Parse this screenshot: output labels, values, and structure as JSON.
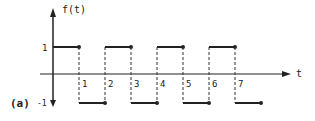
{
  "chart_data": {
    "type": "line",
    "title": "",
    "figure_label": "(a)",
    "xlabel": "t",
    "ylabel": "f(t)",
    "ytick_labels": [
      "1",
      "-1"
    ],
    "yticks": [
      1,
      -1
    ],
    "xtick_labels": [
      "1",
      "2",
      "3",
      "4",
      "5",
      "6",
      "7"
    ],
    "xticks": [
      1,
      2,
      3,
      4,
      5,
      6,
      7
    ],
    "xlim": [
      0,
      8
    ],
    "ylim": [
      -1,
      1
    ],
    "grid": false,
    "style": "square wave, dashed vertical transitions, dots at segment ends",
    "series": [
      {
        "name": "f(t)",
        "segments": [
          {
            "t_start": 0,
            "t_end": 1,
            "value": 1
          },
          {
            "t_start": 1,
            "t_end": 2,
            "value": -1
          },
          {
            "t_start": 2,
            "t_end": 3,
            "value": 1
          },
          {
            "t_start": 3,
            "t_end": 4,
            "value": -1
          },
          {
            "t_start": 4,
            "t_end": 5,
            "value": 1
          },
          {
            "t_start": 5,
            "t_end": 6,
            "value": -1
          },
          {
            "t_start": 6,
            "t_end": 7,
            "value": 1
          },
          {
            "t_start": 7,
            "t_end": 8,
            "value": -1
          }
        ]
      }
    ]
  },
  "colors": {
    "ink": "#222222",
    "background": "#ffffff"
  }
}
